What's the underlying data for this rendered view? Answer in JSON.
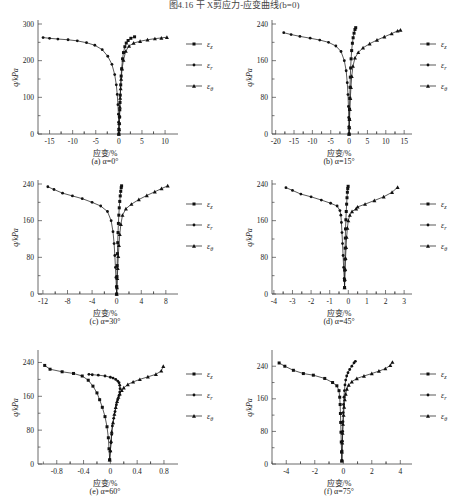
{
  "figure": {
    "title": "图4.16  干  X剪应力-应变曲线(b=0)",
    "background": "#ffffff",
    "line_color": "#111111"
  },
  "axis": {
    "ylabel": "q/kPa",
    "xlabel": "应变/%"
  },
  "legend": {
    "entries": [
      {
        "label": "ε",
        "sub": "z",
        "marker": "square"
      },
      {
        "label": "ε",
        "sub": "r",
        "marker": "circle"
      },
      {
        "label": "ε",
        "sub": "θ",
        "marker": "triangle"
      }
    ]
  },
  "chart_data": [
    {
      "id": "a",
      "type": "line",
      "title": "(a) α=0°",
      "xlabel": "应变/%",
      "ylabel": "q/kPa",
      "xlim": [
        -17.5,
        11.5
      ],
      "ylim": [
        0,
        300
      ],
      "xticks": [
        -15,
        -10,
        -5,
        0,
        5,
        10
      ],
      "yticks": [
        0,
        100,
        200,
        300
      ],
      "grid": false,
      "legend_position": "right",
      "series": [
        {
          "name": "ε_z",
          "marker": "square",
          "x": [
            0,
            0.05,
            0.1,
            0.15,
            0.2,
            0.25,
            0.3,
            0.4,
            0.5,
            0.6,
            0.8,
            1.0,
            1.3,
            1.6,
            2.0,
            2.6,
            3.4
          ],
          "y": [
            0,
            12,
            28,
            46,
            66,
            86,
            106,
            134,
            158,
            178,
            205,
            222,
            238,
            248,
            255,
            261,
            265
          ]
        },
        {
          "name": "ε_r",
          "marker": "circle",
          "x": [
            0,
            -0.02,
            -0.05,
            -0.1,
            -0.2,
            -0.35,
            -0.55,
            -0.9,
            -1.5,
            -2.4,
            -3.6,
            -5.2,
            -7.0,
            -9.0,
            -11.0,
            -13.2,
            -15.0,
            -16.4
          ],
          "y": [
            0,
            14,
            32,
            54,
            80,
            108,
            134,
            162,
            190,
            212,
            230,
            242,
            249,
            254,
            257,
            259,
            261,
            263
          ]
        },
        {
          "name": "ε_θ",
          "marker": "triangle",
          "x": [
            0,
            0.04,
            0.09,
            0.14,
            0.2,
            0.28,
            0.38,
            0.5,
            0.7,
            1.0,
            1.5,
            2.2,
            3.2,
            4.6,
            6.2,
            7.8,
            9.2,
            10.4
          ],
          "y": [
            0,
            12,
            30,
            50,
            74,
            98,
            124,
            150,
            178,
            202,
            226,
            240,
            248,
            253,
            257,
            260,
            262,
            264
          ]
        }
      ]
    },
    {
      "id": "b",
      "type": "line",
      "title": "(b) α=15°",
      "xlabel": "应变/%",
      "ylabel": "q/kPa",
      "xlim": [
        -21,
        15.5
      ],
      "ylim": [
        0,
        240
      ],
      "xticks": [
        -20,
        -15,
        -10,
        -5,
        0,
        5,
        10,
        15
      ],
      "yticks": [
        0,
        80,
        160,
        240
      ],
      "grid": false,
      "legend_position": "right",
      "series": [
        {
          "name": "ε_z",
          "marker": "square",
          "x": [
            0,
            0.03,
            0.07,
            0.12,
            0.18,
            0.25,
            0.33,
            0.42,
            0.55,
            0.7,
            0.9,
            1.1,
            1.35,
            1.6,
            1.8
          ],
          "y": [
            0,
            14,
            32,
            54,
            78,
            102,
            124,
            144,
            164,
            182,
            198,
            210,
            220,
            228,
            232
          ]
        },
        {
          "name": "ε_r",
          "marker": "circle",
          "x": [
            0,
            -0.05,
            -0.1,
            -0.18,
            -0.3,
            -0.5,
            -0.8,
            -1.3,
            -2.2,
            -3.6,
            -5.6,
            -8.0,
            -10.6,
            -13.4,
            -15.8,
            -17.8
          ],
          "y": [
            0,
            16,
            36,
            60,
            86,
            112,
            138,
            160,
            180,
            192,
            200,
            205,
            209,
            213,
            217,
            221
          ]
        },
        {
          "name": "ε_θ",
          "marker": "triangle",
          "x": [
            0,
            0.06,
            0.13,
            0.22,
            0.34,
            0.5,
            0.72,
            1.05,
            1.6,
            2.5,
            3.8,
            5.6,
            7.6,
            9.6,
            11.6,
            13.2,
            14.0
          ],
          "y": [
            0,
            14,
            32,
            54,
            78,
            102,
            126,
            148,
            166,
            178,
            188,
            197,
            205,
            212,
            219,
            225,
            227
          ]
        }
      ]
    },
    {
      "id": "c",
      "type": "line",
      "title": "(c) α=30°",
      "xlabel": "应变/%",
      "ylabel": "q/kPa",
      "xlim": [
        -12.8,
        9
      ],
      "ylim": [
        0,
        240
      ],
      "xticks": [
        -12,
        -8,
        -4,
        0,
        4,
        8
      ],
      "yticks": [
        0,
        80,
        160,
        240
      ],
      "grid": false,
      "legend_position": "right",
      "series": [
        {
          "name": "ε_z",
          "marker": "square",
          "x": [
            0,
            0.02,
            0.05,
            0.08,
            0.12,
            0.17,
            0.22,
            0.28,
            0.35,
            0.42,
            0.5,
            0.58,
            0.66,
            0.74,
            0.8
          ],
          "y": [
            0,
            16,
            38,
            62,
            88,
            112,
            134,
            154,
            172,
            188,
            202,
            214,
            224,
            232,
            236
          ]
        },
        {
          "name": "ε_r",
          "marker": "circle",
          "x": [
            0,
            -0.06,
            -0.12,
            -0.2,
            -0.3,
            -0.42,
            -0.6,
            -0.9,
            -1.5,
            -2.6,
            -4.0,
            -5.6,
            -7.2,
            -8.8,
            -10.2,
            -11.2
          ],
          "y": [
            0,
            16,
            36,
            58,
            84,
            110,
            136,
            160,
            180,
            192,
            200,
            208,
            214,
            220,
            228,
            234
          ]
        },
        {
          "name": "ε_θ",
          "marker": "triangle",
          "x": [
            0,
            0.05,
            0.1,
            0.17,
            0.26,
            0.37,
            0.5,
            0.68,
            0.95,
            1.5,
            2.4,
            3.6,
            4.9,
            6.2,
            7.3,
            8.3
          ],
          "y": [
            0,
            14,
            34,
            56,
            82,
            106,
            130,
            152,
            172,
            186,
            196,
            206,
            215,
            223,
            230,
            236
          ]
        }
      ]
    },
    {
      "id": "d",
      "type": "line",
      "title": "(d) α=45°",
      "xlabel": "应变/%",
      "ylabel": "q/kPa",
      "xlim": [
        -4.1,
        3.1
      ],
      "ylim": [
        0,
        240
      ],
      "xticks": [
        -4,
        -3,
        -2,
        -1,
        0,
        1,
        2,
        3
      ],
      "yticks": [
        0,
        80,
        160,
        240
      ],
      "grid": false,
      "legend_position": "right",
      "series": [
        {
          "name": "ε_z",
          "marker": "square",
          "x": [
            -0.2,
            -0.2,
            -0.19,
            -0.18,
            -0.17,
            -0.16,
            -0.15,
            -0.13,
            -0.11,
            -0.09,
            -0.07,
            -0.05,
            -0.03,
            -0.01
          ],
          "y": [
            14,
            30,
            52,
            76,
            100,
            122,
            142,
            162,
            180,
            196,
            210,
            222,
            230,
            235
          ]
        },
        {
          "name": "ε_r",
          "marker": "circle",
          "x": [
            -0.2,
            -0.22,
            -0.25,
            -0.28,
            -0.31,
            -0.34,
            -0.37,
            -0.4,
            -0.45,
            -0.6,
            -0.95,
            -1.45,
            -2.0,
            -2.55,
            -3.0,
            -3.35
          ],
          "y": [
            14,
            34,
            58,
            84,
            110,
            134,
            156,
            172,
            182,
            192,
            198,
            205,
            212,
            218,
            226,
            232
          ]
        },
        {
          "name": "ε_θ",
          "marker": "triangle",
          "x": [
            -0.2,
            -0.19,
            -0.17,
            -0.15,
            -0.12,
            -0.09,
            -0.05,
            0.0,
            0.08,
            0.2,
            0.42,
            0.5,
            0.9,
            1.4,
            1.9,
            2.35,
            2.65
          ],
          "y": [
            14,
            32,
            54,
            78,
            102,
            124,
            144,
            160,
            172,
            180,
            186,
            190,
            196,
            204,
            212,
            222,
            233
          ]
        }
      ]
    },
    {
      "id": "e",
      "type": "line",
      "title": "(e) α=60°",
      "xlabel": "应变/%",
      "ylabel": "q/kPa",
      "xlim": [
        -1.08,
        0.92
      ],
      "ylim": [
        0,
        260
      ],
      "xticks": [
        -0.8,
        -0.4,
        0,
        0.4,
        0.8
      ],
      "yticks": [
        0,
        80,
        160,
        240
      ],
      "grid": false,
      "legend_position": "right",
      "series": [
        {
          "name": "ε_z",
          "marker": "square",
          "x": [
            -0.01,
            -0.02,
            -0.03,
            -0.05,
            -0.08,
            -0.12,
            -0.16,
            -0.2,
            -0.26,
            -0.33,
            -0.42,
            -0.55,
            -0.72,
            -0.9,
            -0.98
          ],
          "y": [
            10,
            36,
            62,
            88,
            112,
            134,
            152,
            168,
            184,
            198,
            208,
            214,
            218,
            224,
            233
          ]
        },
        {
          "name": "ε_r",
          "marker": "circle",
          "x": [
            -0.01,
            0.0,
            0.01,
            0.02,
            0.03,
            0.05,
            0.07,
            0.09,
            0.11,
            0.13,
            0.14,
            0.145,
            0.14,
            0.13,
            0.11,
            0.08,
            0.04,
            0.0,
            -0.08,
            -0.18,
            -0.27,
            -0.32
          ],
          "y": [
            10,
            30,
            50,
            70,
            90,
            108,
            124,
            140,
            152,
            162,
            170,
            178,
            186,
            192,
            196,
            200,
            203,
            205,
            208,
            210,
            211,
            212
          ]
        },
        {
          "name": "ε_θ",
          "marker": "triangle",
          "x": [
            -0.01,
            0.0,
            0.01,
            0.02,
            0.04,
            0.06,
            0.08,
            0.1,
            0.12,
            0.14,
            0.17,
            0.2,
            0.26,
            0.34,
            0.44,
            0.56,
            0.68,
            0.76,
            0.79
          ],
          "y": [
            10,
            32,
            54,
            76,
            98,
            118,
            134,
            148,
            158,
            166,
            174,
            180,
            188,
            194,
            200,
            206,
            212,
            220,
            231
          ]
        }
      ]
    },
    {
      "id": "f",
      "type": "line",
      "title": "(f) α=75°",
      "xlabel": "应变/%",
      "ylabel": "q/kPa",
      "xlim": [
        -5.0,
        4.4
      ],
      "ylim": [
        0,
        270
      ],
      "xticks": [
        -4,
        -2,
        0,
        2,
        4
      ],
      "yticks": [
        0,
        80,
        160,
        240
      ],
      "grid": false,
      "legend_position": "right",
      "series": [
        {
          "name": "ε_z",
          "marker": "square",
          "x": [
            -0.1,
            -0.12,
            -0.14,
            -0.16,
            -0.18,
            -0.2,
            -0.22,
            -0.25,
            -0.3,
            -0.45,
            -0.75,
            -1.3,
            -2.1,
            -2.8,
            -3.5,
            -4.1,
            -4.5
          ],
          "y": [
            8,
            30,
            54,
            78,
            102,
            124,
            146,
            164,
            180,
            192,
            200,
            210,
            218,
            222,
            230,
            240,
            248
          ]
        },
        {
          "name": "ε_r",
          "marker": "circle",
          "x": [
            -0.1,
            -0.08,
            -0.06,
            -0.04,
            -0.02,
            0.0,
            0.02,
            0.05,
            0.08,
            0.12,
            0.17,
            0.24,
            0.33,
            0.45,
            0.6,
            0.75,
            0.85
          ],
          "y": [
            8,
            32,
            56,
            80,
            104,
            126,
            146,
            164,
            180,
            194,
            206,
            216,
            224,
            232,
            240,
            248,
            252
          ]
        },
        {
          "name": "ε_θ",
          "marker": "triangle",
          "x": [
            -0.1,
            -0.09,
            -0.07,
            -0.05,
            -0.02,
            0.02,
            0.06,
            0.11,
            0.17,
            0.25,
            0.38,
            0.6,
            0.95,
            1.45,
            2.0,
            2.5,
            2.95,
            3.3,
            3.45
          ],
          "y": [
            8,
            30,
            52,
            76,
            98,
            120,
            140,
            158,
            172,
            184,
            194,
            202,
            210,
            216,
            222,
            228,
            234,
            242,
            250
          ]
        }
      ]
    }
  ]
}
